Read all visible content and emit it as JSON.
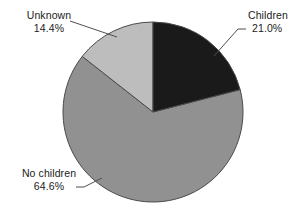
{
  "figure": {
    "background_color": "#ffffff",
    "width": 307,
    "height": 217
  },
  "chart_data": {
    "type": "pie",
    "title": "",
    "subtitle": "",
    "xlabel": "",
    "ylabel": "",
    "legend_position": "none",
    "grid": false,
    "labels_position": "outside-with-leader-lines",
    "start_angle_deg": 0,
    "direction": "clockwise",
    "center": {
      "x": 153,
      "y": 112
    },
    "radius": 90,
    "categories": [
      "Children",
      "No children",
      "Unknown"
    ],
    "values": [
      21.0,
      64.6,
      14.4
    ],
    "value_unit": "%",
    "colors": [
      "#1a1a1a",
      "#919191",
      "#bdbdbd"
    ],
    "slice_border_color": "#4a4a4a",
    "slices": [
      {
        "label": "Children",
        "value": 21.0,
        "value_text": "21.0%",
        "color": "#1a1a1a",
        "start_angle_deg": 0.0,
        "end_angle_deg": 75.6
      },
      {
        "label": "No children",
        "value": 64.6,
        "value_text": "64.6%",
        "color": "#919191",
        "start_angle_deg": 75.6,
        "end_angle_deg": 308.2
      },
      {
        "label": "Unknown",
        "value": 14.4,
        "value_text": "14.4%",
        "color": "#bdbdbd",
        "start_angle_deg": 308.2,
        "end_angle_deg": 360.0
      }
    ]
  },
  "annotations": {
    "children": {
      "name": "Children",
      "percent": "21.0%"
    },
    "no_children": {
      "name": "No children",
      "percent": "64.6%"
    },
    "unknown": {
      "name": "Unknown",
      "percent": "14.4%"
    }
  }
}
